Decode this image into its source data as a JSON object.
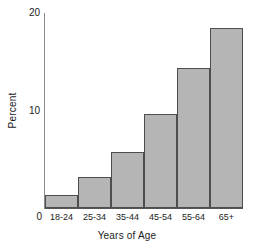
{
  "chart_data": {
    "type": "bar",
    "title": "",
    "xlabel": "Years of Age",
    "ylabel": "Percent",
    "categories": [
      "18-24",
      "25-34",
      "35-44",
      "45-54",
      "55-64",
      "65+"
    ],
    "values": [
      1.3,
      3.2,
      5.7,
      9.6,
      14.4,
      18.5
    ],
    "ylim": [
      0,
      20
    ],
    "yticks": [
      0,
      10,
      20
    ],
    "ytick_labels": [
      "0",
      "10",
      "20"
    ],
    "grid": false,
    "legend": null,
    "bar_fill_color": "#b5b5b5",
    "bar_edge_color": "#4d4d4d",
    "axis_color": "#555555",
    "background_color": "#ffffff"
  }
}
